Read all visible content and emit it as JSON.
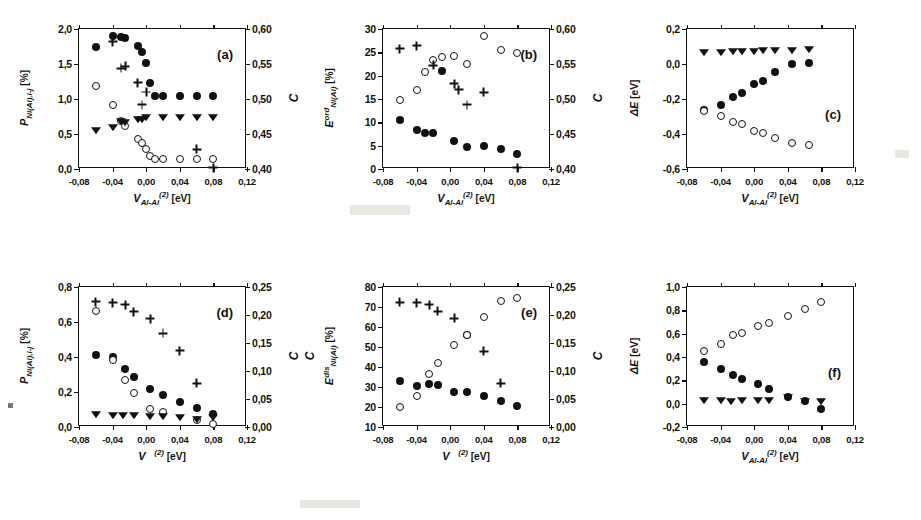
{
  "figure": {
    "kind": "multi-panel scatter figure",
    "panel_count": 6
  },
  "chart_data": [
    {
      "type": "scatter",
      "panel": "a",
      "tag": "(a)",
      "title": "",
      "xlabel": "V_Al-Al^(2) [eV]",
      "xlabel_parts": {
        "base": "V",
        "sub": "Al-Al",
        "sup": "(2)",
        "unit": "[eV]"
      },
      "ylabel": "P_Ni(Al),i-j [%]",
      "ylabel_parts": {
        "base": "P",
        "sub": "Ni(Al),i-j",
        "unit": "[%]"
      },
      "ylabel_right": "C",
      "xlim": [
        -0.08,
        0.12
      ],
      "ylim": [
        0.0,
        2.0
      ],
      "ylim_right": [
        0.4,
        0.6
      ],
      "xticks": [
        -0.08,
        -0.04,
        0.0,
        0.04,
        0.08,
        0.12
      ],
      "xticklabels": [
        "-0,08",
        "-0,04",
        "0,00",
        "0,04",
        "0,08",
        "0,12"
      ],
      "yticks": [
        0.0,
        0.5,
        1.0,
        1.5,
        2.0
      ],
      "yticklabels": [
        "0,0",
        "0,5",
        "1,0",
        "1,5",
        "2,0"
      ],
      "yticks_right": [
        0.4,
        0.45,
        0.5,
        0.55,
        0.6
      ],
      "yticklabels_right": [
        "0,40",
        "0,45",
        "0,50",
        "0,55",
        "0,60"
      ],
      "grid": false,
      "legend": false,
      "series": [
        {
          "name": "filled-circle",
          "marker": "filled",
          "x": [
            -0.06,
            -0.04,
            -0.03,
            -0.025,
            -0.01,
            -0.005,
            0.0,
            0.005,
            0.01,
            0.02,
            0.04,
            0.06,
            0.08
          ],
          "y": [
            1.74,
            1.9,
            1.88,
            1.87,
            1.76,
            1.67,
            1.52,
            1.23,
            1.04,
            1.04,
            1.04,
            1.04,
            1.04
          ]
        },
        {
          "name": "open-circle",
          "marker": "open",
          "x": [
            -0.06,
            -0.04,
            -0.03,
            -0.025,
            -0.01,
            -0.005,
            0.0,
            0.005,
            0.01,
            0.02,
            0.04,
            0.06,
            0.08
          ],
          "y": [
            1.19,
            0.91,
            0.68,
            0.62,
            0.43,
            0.37,
            0.28,
            0.19,
            0.14,
            0.14,
            0.14,
            0.14,
            0.14
          ]
        },
        {
          "name": "filled-triangle-down",
          "marker": "tri",
          "x": [
            -0.06,
            -0.04,
            -0.03,
            -0.025,
            -0.01,
            -0.005,
            0.0,
            0.02,
            0.04,
            0.06,
            0.08
          ],
          "y": [
            0.56,
            0.6,
            0.69,
            0.67,
            0.72,
            0.71,
            0.74,
            0.74,
            0.74,
            0.74,
            0.74
          ]
        },
        {
          "name": "plus",
          "marker": "plus",
          "x": [
            -0.04,
            -0.03,
            -0.025,
            -0.01,
            -0.005,
            0.0,
            0.06,
            0.08
          ],
          "y": [
            1.82,
            1.44,
            1.47,
            1.23,
            0.92,
            1.1,
            0.28,
            0.02
          ]
        }
      ]
    },
    {
      "type": "scatter",
      "panel": "b",
      "tag": "(b)",
      "title": "",
      "xlabel": "V_Al-Al^(2) [eV]",
      "xlabel_parts": {
        "base": "V",
        "sub": "Al-Al",
        "sup": "(2)",
        "unit": "[eV]"
      },
      "ylabel": "E^ord_Ni(Al) [%]",
      "ylabel_parts": {
        "base": "E",
        "sup": "ord",
        "sub": "Ni(Al)",
        "unit": "[%]"
      },
      "ylabel_right": "C",
      "xlim": [
        -0.08,
        0.12
      ],
      "ylim": [
        0,
        30
      ],
      "ylim_right": [
        0.4,
        0.6
      ],
      "xticks": [
        -0.08,
        -0.04,
        0.0,
        0.04,
        0.08,
        0.12
      ],
      "xticklabels": [
        "-0,08",
        "-0,04",
        "0,00",
        "0,04",
        "0,08",
        "0,12"
      ],
      "yticks": [
        0,
        5,
        10,
        15,
        20,
        25,
        30
      ],
      "yticklabels": [
        "0",
        "5",
        "10",
        "15",
        "20",
        "25",
        "30"
      ],
      "yticks_right": [
        0.4,
        0.45,
        0.5,
        0.55,
        0.6
      ],
      "yticklabels_right": [
        "0,40",
        "0,45",
        "0,50",
        "0,55",
        "0,60"
      ],
      "grid": false,
      "legend": false,
      "series": [
        {
          "name": "filled-circle",
          "marker": "filled",
          "x": [
            -0.06,
            -0.04,
            -0.03,
            -0.02,
            -0.01,
            0.005,
            0.02,
            0.04,
            0.06,
            0.08
          ],
          "y": [
            10.4,
            8.3,
            7.7,
            7.7,
            21.0,
            6.0,
            4.8,
            5.0,
            4.2,
            3.2
          ]
        },
        {
          "name": "open-circle",
          "marker": "open",
          "x": [
            -0.06,
            -0.04,
            -0.03,
            -0.02,
            -0.01,
            0.005,
            0.02,
            0.04,
            0.06,
            0.08
          ],
          "y": [
            14.8,
            16.9,
            20.7,
            23.3,
            24.0,
            24.2,
            22.4,
            28.4,
            25.4,
            24.8
          ]
        },
        {
          "name": "plus",
          "marker": "plus",
          "x": [
            -0.06,
            -0.04,
            -0.02,
            0.005,
            0.01,
            0.02,
            0.04,
            0.08
          ],
          "y": [
            25.8,
            26.4,
            22.2,
            18.3,
            17.0,
            13.8,
            16.4,
            0.3
          ]
        }
      ]
    },
    {
      "type": "scatter",
      "panel": "c",
      "tag": "(c)",
      "title": "",
      "xlabel": "V_Al-Al^(2) [eV]",
      "xlabel_parts": {
        "base": "V",
        "sub": "Al-Al",
        "sup": "(2)",
        "unit": "[eV]"
      },
      "ylabel": "ΔE [eV]",
      "ylabel_parts": {
        "base": "ΔE",
        "sub": "",
        "unit": "[eV]"
      },
      "ylabel_right": "",
      "xlim": [
        -0.08,
        0.12
      ],
      "ylim": [
        -0.6,
        0.2
      ],
      "xticks": [
        -0.08,
        -0.04,
        0.0,
        0.04,
        0.08,
        0.12
      ],
      "xticklabels": [
        "-0,08",
        "-0,04",
        "0,00",
        "0,04",
        "0,08",
        "0,12"
      ],
      "yticks": [
        -0.6,
        -0.4,
        -0.2,
        0.0,
        0.2
      ],
      "yticklabels": [
        "-0,6",
        "-0,4",
        "-0,2",
        "0,0",
        "0,2"
      ],
      "grid": false,
      "legend": false,
      "series": [
        {
          "name": "filled-circle",
          "marker": "filled",
          "x": [
            -0.06,
            -0.04,
            -0.025,
            -0.015,
            0.0,
            0.01,
            0.025,
            0.045,
            0.065
          ],
          "y": [
            -0.265,
            -0.233,
            -0.186,
            -0.163,
            -0.117,
            -0.095,
            -0.048,
            0.0,
            0.005
          ]
        },
        {
          "name": "open-circle",
          "marker": "open",
          "x": [
            -0.06,
            -0.04,
            -0.025,
            -0.015,
            0.0,
            0.01,
            0.025,
            0.045,
            0.065
          ],
          "y": [
            -0.27,
            -0.296,
            -0.333,
            -0.34,
            -0.382,
            -0.397,
            -0.42,
            -0.45,
            -0.46
          ]
        },
        {
          "name": "filled-triangle-down",
          "marker": "tri",
          "x": [
            -0.06,
            -0.04,
            -0.025,
            -0.015,
            0.0,
            0.01,
            0.025,
            0.045,
            0.065
          ],
          "y": [
            0.068,
            0.07,
            0.072,
            0.073,
            0.076,
            0.078,
            0.08,
            0.082,
            0.084
          ]
        }
      ]
    },
    {
      "type": "scatter",
      "panel": "d",
      "tag": "(d)",
      "title": "",
      "xlabel": "V ^(2) [eV]",
      "xlabel_parts": {
        "base": "V",
        "sub": "",
        "sup": "(2)",
        "unit": "[eV]"
      },
      "ylabel": "P_Ni(Al),i-j [%]",
      "ylabel_parts": {
        "base": "P",
        "sub": "Ni(Al),i-j",
        "unit": "[%]"
      },
      "ylabel_right": "C",
      "xlim": [
        -0.08,
        0.12
      ],
      "ylim": [
        0.0,
        0.8
      ],
      "ylim_right": [
        0.0,
        0.25
      ],
      "xticks": [
        -0.08,
        -0.04,
        0.0,
        0.04,
        0.08,
        0.12
      ],
      "xticklabels": [
        "-0,08",
        "-0,04",
        "0,00",
        "0,04",
        "0,08",
        "0,12"
      ],
      "yticks": [
        0.0,
        0.2,
        0.4,
        0.6,
        0.8
      ],
      "yticklabels": [
        "0,0",
        "0,2",
        "0,4",
        "0,6",
        "0,8"
      ],
      "yticks_right": [
        0.0,
        0.05,
        0.1,
        0.15,
        0.2,
        0.25
      ],
      "yticklabels_right": [
        "0,00",
        "0,05",
        "0,10",
        "0,15",
        "0,20",
        "0,25"
      ],
      "grid": false,
      "legend": false,
      "series": [
        {
          "name": "filled-circle",
          "marker": "filled",
          "x": [
            -0.06,
            -0.04,
            -0.025,
            -0.015,
            0.005,
            0.02,
            0.04,
            0.06,
            0.08
          ],
          "y": [
            0.41,
            0.4,
            0.33,
            0.285,
            0.215,
            0.185,
            0.145,
            0.11,
            0.075
          ]
        },
        {
          "name": "open-circle",
          "marker": "open",
          "x": [
            -0.06,
            -0.04,
            -0.025,
            -0.015,
            0.005,
            0.02,
            0.06,
            0.08
          ],
          "y": [
            0.665,
            0.385,
            0.27,
            0.195,
            0.105,
            0.085,
            0.04,
            0.02
          ]
        },
        {
          "name": "filled-triangle-down",
          "marker": "tri",
          "x": [
            -0.06,
            -0.04,
            -0.028,
            -0.015,
            0.005,
            0.02,
            0.04,
            0.06,
            0.08
          ],
          "y": [
            0.075,
            0.07,
            0.068,
            0.068,
            0.062,
            0.065,
            0.06,
            0.045,
            0.06
          ]
        },
        {
          "name": "plus",
          "marker": "plus",
          "x": [
            -0.06,
            -0.04,
            -0.025,
            -0.015,
            0.005,
            0.02,
            0.04,
            0.06
          ],
          "y": [
            0.715,
            0.71,
            0.7,
            0.66,
            0.62,
            0.535,
            0.435,
            0.25
          ]
        }
      ]
    },
    {
      "type": "scatter",
      "panel": "e",
      "tag": "(e)",
      "title": "",
      "xlabel": "V ^(2) [eV]",
      "xlabel_parts": {
        "base": "V",
        "sub": "",
        "sup": "(2)",
        "unit": "[eV]"
      },
      "ylabel": "E^dis_Ni(Al) [%]",
      "ylabel_parts": {
        "base": "E",
        "sup": "dis",
        "sub": "Ni(Al)",
        "unit": "[%]"
      },
      "ylabel_right": "C",
      "ylabel_left_extra": "C",
      "xlim": [
        -0.08,
        0.12
      ],
      "ylim": [
        10,
        80
      ],
      "ylim_right": [
        0.0,
        0.25
      ],
      "xticks": [
        -0.08,
        -0.04,
        0.0,
        0.04,
        0.08,
        0.12
      ],
      "xticklabels": [
        "-0,08",
        "-0,04",
        "0,00",
        "0,04",
        "0,08",
        "0,12"
      ],
      "yticks": [
        10,
        20,
        30,
        40,
        50,
        60,
        70,
        80
      ],
      "yticklabels": [
        "10",
        "20",
        "30",
        "40",
        "50",
        "60",
        "70",
        "80"
      ],
      "yticks_right": [
        0.0,
        0.05,
        0.1,
        0.15,
        0.2,
        0.25
      ],
      "yticklabels_right": [
        "0,00",
        "0,05",
        "0,10",
        "0,15",
        "0,20",
        "0,25"
      ],
      "grid": false,
      "legend": false,
      "series": [
        {
          "name": "filled-circle",
          "marker": "filled",
          "x": [
            -0.06,
            -0.04,
            -0.025,
            -0.015,
            0.005,
            0.02,
            0.02,
            0.04,
            0.06,
            0.08
          ],
          "y": [
            33.0,
            30.3,
            31.3,
            31.2,
            27.3,
            27.6,
            56.2,
            25.4,
            23.2,
            20.6
          ]
        },
        {
          "name": "open-circle",
          "marker": "open",
          "x": [
            -0.06,
            -0.04,
            -0.025,
            -0.015,
            0.005,
            0.02,
            0.04,
            0.06,
            0.08
          ],
          "y": [
            20.0,
            25.4,
            36.5,
            41.8,
            51.0,
            56.2,
            65.2,
            73.0,
            74.6
          ]
        },
        {
          "name": "plus",
          "marker": "plus",
          "x": [
            -0.06,
            -0.04,
            -0.025,
            -0.015,
            0.005,
            0.04,
            0.06
          ],
          "y": [
            72.4,
            72.2,
            71.2,
            67.8,
            64.3,
            47.8,
            31.8
          ]
        }
      ]
    },
    {
      "type": "scatter",
      "panel": "f",
      "tag": "(f)",
      "title": "",
      "xlabel": "V_Al-Al^(2) [eV]",
      "xlabel_parts": {
        "base": "V",
        "sub": "Al-Al",
        "sup": "(2)",
        "unit": "[eV]"
      },
      "ylabel": "ΔE [eV]",
      "ylabel_parts": {
        "base": "ΔE",
        "sub": "",
        "unit": "[eV]"
      },
      "ylabel_right": "",
      "xlim": [
        -0.08,
        0.12
      ],
      "ylim": [
        -0.2,
        1.0
      ],
      "xticks": [
        -0.08,
        -0.04,
        0.0,
        0.04,
        0.08,
        0.12
      ],
      "xticklabels": [
        "-0,08",
        "-0,04",
        "0,00",
        "0,04",
        "0,08",
        "0,12"
      ],
      "yticks": [
        -0.2,
        0.0,
        0.2,
        0.4,
        0.6,
        0.8,
        1.0
      ],
      "yticklabels": [
        "-0,2",
        "0,0",
        "0,2",
        "0,4",
        "0,6",
        "0,8",
        "1,0"
      ],
      "grid": false,
      "legend": false,
      "series": [
        {
          "name": "filled-circle",
          "marker": "filled",
          "x": [
            -0.06,
            -0.04,
            -0.025,
            -0.015,
            0.005,
            0.018,
            0.04,
            0.06,
            0.08
          ],
          "y": [
            0.355,
            0.3,
            0.245,
            0.215,
            0.165,
            0.13,
            0.055,
            0.02,
            -0.045
          ]
        },
        {
          "name": "open-circle",
          "marker": "open",
          "x": [
            -0.06,
            -0.04,
            -0.025,
            -0.015,
            0.005,
            0.018,
            0.04,
            0.06,
            0.08
          ],
          "y": [
            0.455,
            0.51,
            0.585,
            0.605,
            0.665,
            0.69,
            0.755,
            0.815,
            0.875
          ]
        },
        {
          "name": "filled-triangle-down",
          "marker": "tri",
          "x": [
            -0.06,
            -0.04,
            -0.028,
            -0.015,
            0.005,
            0.018,
            0.04,
            0.06,
            0.08
          ],
          "y": [
            0.03,
            0.035,
            0.025,
            0.028,
            0.03,
            0.03,
            0.06,
            0.02,
            0.02
          ]
        }
      ]
    }
  ]
}
